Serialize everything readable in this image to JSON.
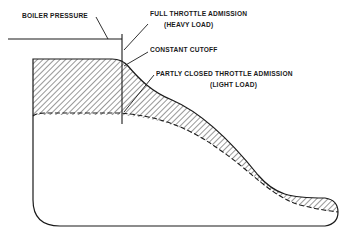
{
  "diagram": {
    "title": "",
    "type": "steam engine indicator diagram",
    "labels": {
      "boiler_pressure": "BOILER PRESSURE",
      "full_throttle_line1": "FULL THROTTLE ADMISSION",
      "full_throttle_line2": "(HEAVY LOAD)",
      "constant_cutoff": "CONSTANT CUTOFF",
      "partly_closed_line1": "PARTLY CLOSED THROTTLE ADMISSION",
      "partly_closed_line2": "(LIGHT LOAD)"
    },
    "caption": "",
    "colors": {
      "ink": "#1a1a1a",
      "background": "#ffffff",
      "caption": "#9a9a9a"
    }
  }
}
